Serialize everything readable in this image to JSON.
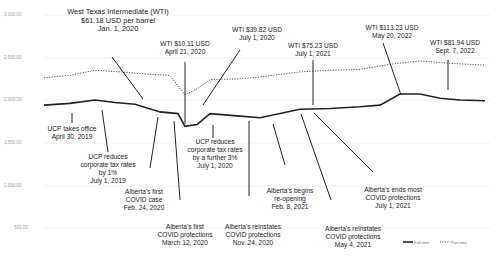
{
  "chart_data": {
    "type": "line",
    "title": "",
    "xlabel": "",
    "ylabel": "",
    "ylim": [
      0,
      3000
    ],
    "y_ticks": [
      "3,000.00",
      "2,500.00",
      "2,000.00",
      "1,500.00",
      "1,000.00",
      "500.00",
      "0"
    ],
    "grid": true,
    "legend_position": "bottom-right",
    "x_range": [
      "Jan 2019",
      "Sept 2022"
    ],
    "series": [
      {
        "name": "Full-time",
        "style": "solid",
        "points": [
          [
            44,
            1940
          ],
          [
            70,
            1960
          ],
          [
            95,
            2000
          ],
          [
            115,
            1970
          ],
          [
            135,
            1950
          ],
          [
            160,
            1860
          ],
          [
            178,
            1840
          ],
          [
            185,
            1690
          ],
          [
            197,
            1710
          ],
          [
            210,
            1840
          ],
          [
            240,
            1810
          ],
          [
            260,
            1790
          ],
          [
            300,
            1890
          ],
          [
            330,
            1900
          ],
          [
            360,
            1920
          ],
          [
            380,
            1940
          ],
          [
            400,
            2070
          ],
          [
            420,
            2070
          ],
          [
            440,
            2020
          ],
          [
            460,
            2000
          ],
          [
            485,
            1990
          ]
        ]
      },
      {
        "name": "Part-time",
        "style": "dotted",
        "points": [
          [
            44,
            2260
          ],
          [
            70,
            2290
          ],
          [
            95,
            2350
          ],
          [
            120,
            2330
          ],
          [
            150,
            2300
          ],
          [
            170,
            2290
          ],
          [
            185,
            2060
          ],
          [
            197,
            2130
          ],
          [
            210,
            2240
          ],
          [
            240,
            2250
          ],
          [
            260,
            2270
          ],
          [
            300,
            2330
          ],
          [
            330,
            2350
          ],
          [
            360,
            2360
          ],
          [
            390,
            2420
          ],
          [
            420,
            2460
          ],
          [
            450,
            2430
          ],
          [
            485,
            2410
          ]
        ]
      }
    ],
    "annotations": [
      {
        "id": "wti-jan2020",
        "lines": [
          "West Texas Intermediate (WTI)",
          "$61.18 USD per barrel",
          "Jan. 1, 2020"
        ]
      },
      {
        "id": "wti-apr2020",
        "lines": [
          "WTI $10.11 USD",
          "April 21, 2020"
        ]
      },
      {
        "id": "wti-jul2020",
        "lines": [
          "WTI $39.82 USD",
          "July 1, 2020"
        ]
      },
      {
        "id": "wti-jul2021",
        "lines": [
          "WTI $75.23 USD",
          "July 1, 2021"
        ]
      },
      {
        "id": "wti-may2022",
        "lines": [
          "WTI $113.23 USD",
          "May 20, 2022"
        ]
      },
      {
        "id": "wti-sep2022",
        "lines": [
          "WTI $81.94 USD",
          "Sept. 7, 2022"
        ]
      },
      {
        "id": "ucp-office",
        "lines": [
          "UCP takes office",
          "April 30, 2019"
        ]
      },
      {
        "id": "ucp-tax1",
        "lines": [
          "UCP reduces",
          "corporate tax rates",
          "by 1%",
          "July 1, 2019"
        ]
      },
      {
        "id": "first-case",
        "lines": [
          "Alberta's first",
          "COVID case",
          "Feb. 24, 2020"
        ]
      },
      {
        "id": "first-protections",
        "lines": [
          "Alberta's first",
          "COVID protections",
          "March 12, 2020"
        ]
      },
      {
        "id": "ucp-tax3",
        "lines": [
          "UCP reduces",
          "corporate tax rates",
          "by a further 3%",
          "July 1, 2020"
        ]
      },
      {
        "id": "reinstate-nov2020",
        "lines": [
          "Alberta's reinstates",
          "COVID protections",
          "Nov. 24, 2020"
        ]
      },
      {
        "id": "reopening",
        "lines": [
          "Alberta's begins",
          "re-opening",
          "Feb. 8, 2021"
        ]
      },
      {
        "id": "reinstate-may2021",
        "lines": [
          "Alberta's reinstates",
          "COVID protections",
          "May 4, 2021"
        ]
      },
      {
        "id": "ends-protections",
        "lines": [
          "Alberta's ends most",
          "COVID protections",
          "July 1, 2021"
        ]
      }
    ]
  },
  "legend": {
    "full_time": "Full-time",
    "part_time": "Part-time"
  }
}
